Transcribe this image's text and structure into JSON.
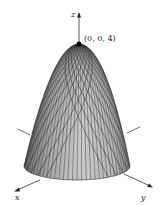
{
  "figure": {
    "surface": "paraboloid z = 4 - x^2 - y^2 (downward-opening)",
    "axes": {
      "x_label": "x",
      "y_label": "y",
      "z_label": "z"
    },
    "vertex": {
      "label": "(0, 0, 4)",
      "coords": [
        0,
        0,
        4
      ]
    },
    "colors": {
      "surface_fill": "#a9a9a9",
      "surface_light": "#c8c8c8",
      "mesh": "#3a3a3a",
      "axis": "#333333",
      "point": "#000000"
    }
  }
}
